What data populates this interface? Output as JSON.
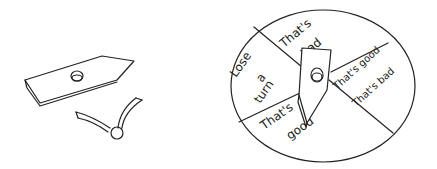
{
  "illustration": {
    "subject": "spinner game parts and assembled spinner",
    "parts": [
      {
        "name": "arrow-pointer",
        "description": "flat arrow piece with hole"
      },
      {
        "name": "paper-fastener",
        "description": "brad with two split legs"
      }
    ],
    "spinner": {
      "sections": [
        {
          "lines": [
            "Lose",
            "a",
            "turn"
          ]
        },
        {
          "lines": [
            "That's",
            "bad"
          ]
        },
        {
          "lines": [
            "That's good",
            "That's bad"
          ]
        },
        {
          "lines": [
            "That's",
            "good"
          ]
        }
      ]
    }
  }
}
